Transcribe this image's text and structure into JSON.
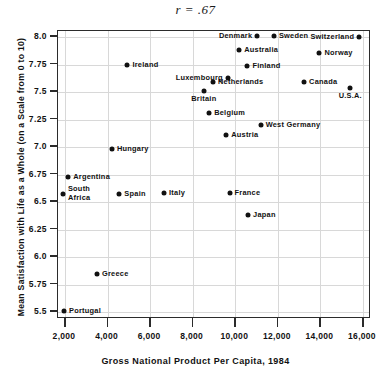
{
  "chart_data": {
    "type": "scatter",
    "title": "r = .67",
    "xlabel": "Gross National Product Per Capita, 1984",
    "ylabel": "Mean Satisfaction with Life as a Whole (on a Scale from 0 to 10)",
    "xlim": [
      1500,
      16500
    ],
    "ylim": [
      5.4,
      8.07
    ],
    "grid": true,
    "legend": "none",
    "xticks": [
      2000,
      4000,
      6000,
      8000,
      10000,
      12000,
      14000,
      16000
    ],
    "xticklabels": [
      "2,000",
      "4,000",
      "6,000",
      "8,000",
      "10,000",
      "12,000",
      "14,000",
      "16,000"
    ],
    "yticks": [
      5.5,
      5.75,
      6.0,
      6.25,
      6.5,
      6.75,
      7.0,
      7.25,
      7.5,
      7.75,
      8.0
    ],
    "yticklabels": [
      "5.5",
      "5.75",
      "6.0",
      "6.25",
      "6.5",
      "6.75",
      "7.0",
      "7.25",
      "7.5",
      "7.75",
      "8.0"
    ],
    "annotation": "r = .67",
    "points": [
      {
        "label": "Portugal",
        "x": 2000,
        "y": 5.5,
        "pos": "r"
      },
      {
        "label": "Greece",
        "x": 3550,
        "y": 5.84,
        "pos": "r"
      },
      {
        "label": "South Africa",
        "x": 1950,
        "y": 6.56,
        "pos": "r"
      },
      {
        "label": "Argentina",
        "x": 2200,
        "y": 6.72,
        "pos": "r"
      },
      {
        "label": "Hungary",
        "x": 4250,
        "y": 6.97,
        "pos": "r"
      },
      {
        "label": "Spain",
        "x": 4600,
        "y": 6.56,
        "pos": "r"
      },
      {
        "label": "Italy",
        "x": 6700,
        "y": 6.57,
        "pos": "r"
      },
      {
        "label": "France",
        "x": 9780,
        "y": 6.57,
        "pos": "r"
      },
      {
        "label": "Japan",
        "x": 10650,
        "y": 6.37,
        "pos": "r"
      },
      {
        "label": "Austria",
        "x": 9620,
        "y": 7.1,
        "pos": "r"
      },
      {
        "label": "Belgium",
        "x": 8820,
        "y": 7.3,
        "pos": "r"
      },
      {
        "label": "Britain",
        "x": 8570,
        "y": 7.5,
        "pos": "b"
      },
      {
        "label": "West Germany",
        "x": 11240,
        "y": 7.19,
        "pos": "r"
      },
      {
        "label": "Netherlands",
        "x": 9000,
        "y": 7.58,
        "pos": "r"
      },
      {
        "label": "Ireland",
        "x": 4980,
        "y": 7.74,
        "pos": "r"
      },
      {
        "label": "Luxembourg",
        "x": 9700,
        "y": 7.62,
        "pos": "l"
      },
      {
        "label": "Finland",
        "x": 10620,
        "y": 7.73,
        "pos": "r"
      },
      {
        "label": "Australia",
        "x": 10230,
        "y": 7.87,
        "pos": "r"
      },
      {
        "label": "Denmark",
        "x": 11080,
        "y": 8.0,
        "pos": "l"
      },
      {
        "label": "Sweden",
        "x": 11860,
        "y": 8.0,
        "pos": "r"
      },
      {
        "label": "Canada",
        "x": 13280,
        "y": 7.58,
        "pos": "r"
      },
      {
        "label": "Norway",
        "x": 14000,
        "y": 7.85,
        "pos": "r"
      },
      {
        "label": "Switzerland",
        "x": 15870,
        "y": 7.99,
        "pos": "l"
      },
      {
        "label": "U.S.A.",
        "x": 15450,
        "y": 7.53,
        "pos": "b"
      }
    ]
  },
  "colors": {
    "point": "#111111",
    "grid": "#d8d8d8",
    "axis": "#2b2b2b",
    "background": "#ffffff"
  }
}
